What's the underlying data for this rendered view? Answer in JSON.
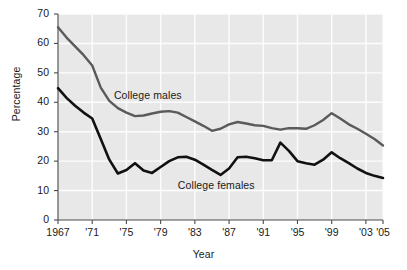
{
  "chart_data": {
    "type": "line",
    "title": "",
    "xlabel": "Year",
    "ylabel": "Percentage",
    "xlim": [
      1967,
      2005
    ],
    "ylim": [
      0,
      70
    ],
    "grid": true,
    "legend_position": "inline-annotation",
    "x_tick_labels": [
      "1967",
      "'71",
      "'75",
      "'79",
      "'83",
      "'87",
      "'91",
      "'95",
      "'99",
      "'03",
      "'05"
    ],
    "x_tick_values": [
      1967,
      1971,
      1975,
      1979,
      1983,
      1987,
      1991,
      1995,
      1999,
      2003,
      2005
    ],
    "y_tick_labels": [
      "0",
      "10",
      "20",
      "30",
      "40",
      "50",
      "60",
      "70"
    ],
    "y_tick_values": [
      0,
      10,
      20,
      30,
      40,
      50,
      60,
      70
    ],
    "x": [
      1967,
      1968,
      1969,
      1970,
      1971,
      1972,
      1973,
      1974,
      1975,
      1976,
      1977,
      1978,
      1979,
      1980,
      1981,
      1982,
      1983,
      1984,
      1985,
      1986,
      1987,
      1988,
      1989,
      1990,
      1991,
      1992,
      1993,
      1994,
      1995,
      1996,
      1997,
      1998,
      1999,
      2000,
      2001,
      2002,
      2003,
      2004,
      2005
    ],
    "series": [
      {
        "name": "College males",
        "color": "#5a5a5a",
        "label_x": 1977.5,
        "label_y": 42.5,
        "values": [
          65.5,
          62.0,
          59.0,
          56.0,
          52.5,
          45.0,
          40.5,
          38.0,
          36.5,
          35.3,
          35.5,
          36.2,
          36.8,
          37.0,
          36.5,
          35.0,
          33.5,
          32.0,
          30.3,
          31.0,
          32.5,
          33.3,
          32.8,
          32.2,
          32.0,
          31.2,
          30.7,
          31.2,
          31.2,
          31.0,
          32.2,
          34.0,
          36.3,
          34.5,
          32.5,
          31.0,
          29.3,
          27.5,
          25.3
        ]
      },
      {
        "name": "College females",
        "color": "#111111",
        "label_x": 1985.5,
        "label_y": 12.0,
        "values": [
          44.8,
          41.5,
          38.8,
          36.5,
          34.5,
          27.5,
          20.5,
          15.8,
          17.0,
          19.3,
          16.8,
          16.0,
          18.0,
          20.0,
          21.3,
          21.5,
          20.5,
          18.8,
          17.0,
          15.3,
          17.5,
          21.3,
          21.5,
          21.0,
          20.3,
          20.3,
          26.3,
          23.5,
          20.0,
          19.3,
          18.8,
          20.5,
          23.0,
          21.0,
          19.3,
          17.5,
          16.0,
          15.0,
          14.3
        ]
      }
    ]
  },
  "styling": {
    "plot_background": "#e8e8e8",
    "gridline_color": "#fdfdfd",
    "axis_color": "#4a4a4a",
    "text_color": "#1a1a1a"
  }
}
